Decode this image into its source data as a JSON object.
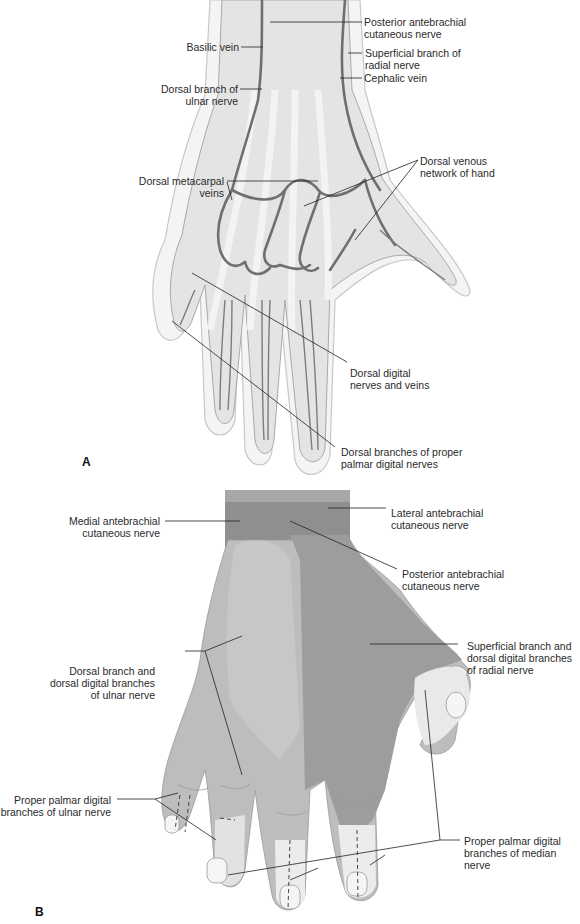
{
  "figure": {
    "panels": [
      {
        "id": "A",
        "letter": "A",
        "view": "Dorsal hand - veins and nerves",
        "labels": [
          {
            "id": "posterior_antebrachial_a",
            "line1": "Posterior antebrachial",
            "line2": "cutaneous nerve"
          },
          {
            "id": "basilic_vein",
            "line1": "Basilic vein",
            "line2": ""
          },
          {
            "id": "superficial_radial",
            "line1": "Superficial branch of",
            "line2": "radial nerve"
          },
          {
            "id": "cephalic_vein",
            "line1": "Cephalic vein",
            "line2": ""
          },
          {
            "id": "dorsal_ulnar",
            "line1": "Dorsal branch of",
            "line2": "ulnar nerve"
          },
          {
            "id": "dorsal_metacarpal",
            "line1": "Dorsal metacarpal",
            "line2": "veins"
          },
          {
            "id": "dorsal_venous_network",
            "line1": "Dorsal venous",
            "line2": "network of hand"
          },
          {
            "id": "dorsal_digital",
            "line1": "Dorsal digital",
            "line2": "nerves and veins"
          },
          {
            "id": "dorsal_branches_proper",
            "line1": "Dorsal branches of proper",
            "line2": "palmar digital nerves"
          }
        ]
      },
      {
        "id": "B",
        "letter": "B",
        "view": "Dorsal hand - cutaneous innervation zones",
        "labels": [
          {
            "id": "medial_antebrachial",
            "line1": "Medial antebrachial",
            "line2": "cutaneous nerve",
            "line3": ""
          },
          {
            "id": "lateral_antebrachial",
            "line1": "Lateral antebrachial",
            "line2": "cutaneous nerve",
            "line3": ""
          },
          {
            "id": "posterior_antebrachial_b",
            "line1": "Posterior antebrachial",
            "line2": "cutaneous nerve",
            "line3": ""
          },
          {
            "id": "dorsal_ulnar_digital",
            "line1": "Dorsal branch and",
            "line2": "dorsal digital branches",
            "line3": "of ulnar nerve"
          },
          {
            "id": "superficial_radial_digital",
            "line1": "Superficial branch and",
            "line2": "dorsal digital branches",
            "line3": "of radial nerve"
          },
          {
            "id": "proper_palmar_ulnar",
            "line1": "Proper palmar digital",
            "line2": "branches of ulnar nerve",
            "line3": ""
          },
          {
            "id": "proper_palmar_median",
            "line1": "Proper palmar digital",
            "line2": "branches of median",
            "line3": "nerve"
          }
        ]
      }
    ],
    "colors": {
      "ink": "#2a2a2a",
      "skin_outline": "#bdbdbd",
      "vein": "#6f6f6f",
      "ulnar_zone": "#b9b9b9",
      "radial_zone": "#9a9a9a",
      "median_zone": "#e6e6e6",
      "forearm_zone": "#8f8f8f"
    }
  }
}
